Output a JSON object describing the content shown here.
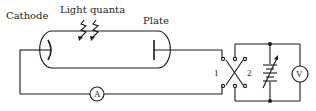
{
  "diagram": {
    "labels": {
      "cathode": "Cathode",
      "light": "Light quanta",
      "plate": "Plate"
    },
    "components": {
      "ammeter": "A",
      "voltmeter": "V",
      "switch_pos_1": "1",
      "switch_pos_2": "2"
    },
    "nodes": [
      {
        "id": "vacuum-tube",
        "desc": "Evacuated tube with cathode and plate"
      },
      {
        "id": "light-quanta-arrows",
        "desc": "Two zigzag arrows incident on cathode"
      },
      {
        "id": "ammeter",
        "desc": "Current meter A in series"
      },
      {
        "id": "reversing-switch",
        "desc": "DPDT switch positions 1 and 2"
      },
      {
        "id": "variable-battery",
        "desc": "Variable voltage source"
      },
      {
        "id": "voltmeter",
        "desc": "Voltmeter V in parallel with battery"
      }
    ],
    "colors": {
      "line": "#1a1a1a",
      "background": "#ffffff"
    }
  }
}
